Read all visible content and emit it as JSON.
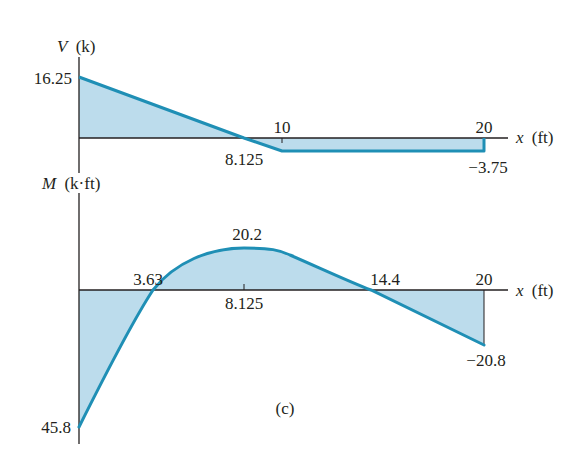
{
  "figure_label": "(c)",
  "colors": {
    "curve": "#1f8fb5",
    "fill": "#bcdcec",
    "axis": "#231f20",
    "text": "#231f20"
  },
  "shear_diagram": {
    "y_axis_symbol": "V",
    "y_axis_unit": "(k)",
    "x_axis_symbol": "x",
    "x_axis_unit": "(ft)",
    "labels": {
      "start_value": "16.25",
      "zero_crossing": "8.125",
      "tick_10": "10",
      "tick_20": "20",
      "end_value": "−3.75"
    },
    "points": [
      {
        "x": 0,
        "v": 16.25
      },
      {
        "x": 8.125,
        "v": 0
      },
      {
        "x": 10,
        "v": -3.75
      },
      {
        "x": 20,
        "v": -3.75
      }
    ]
  },
  "moment_diagram": {
    "y_axis_symbol": "M",
    "y_axis_unit": "(k·ft)",
    "x_axis_symbol": "x",
    "x_axis_unit": "(ft)",
    "labels": {
      "first_zero": "3.63",
      "max_location": "8.125",
      "max_value": "20.2",
      "second_zero": "14.4",
      "tick_20": "20",
      "end_value": "−20.8",
      "start_value": "45.8"
    },
    "points": [
      {
        "x": 0,
        "m": -45.8
      },
      {
        "x": 3.63,
        "m": 0
      },
      {
        "x": 8.125,
        "m": 20.2
      },
      {
        "x": 10,
        "m": 16.7
      },
      {
        "x": 14.4,
        "m": 0
      },
      {
        "x": 20,
        "m": -20.8
      }
    ]
  }
}
